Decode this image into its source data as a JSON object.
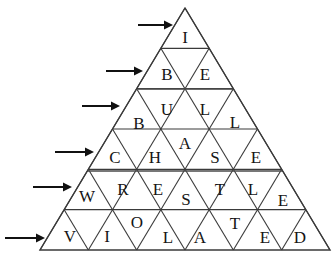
{
  "figure": {
    "background_color": "#ffffff",
    "line_color": "#3a3a3a",
    "text_color": "#151515",
    "arrow_color": "#111111",
    "apex": {
      "x": 185,
      "y": 8
    },
    "base_left": {
      "x": 40,
      "y": 250
    },
    "base_right": {
      "x": 330,
      "y": 250
    },
    "row_height": 40.3,
    "row_count": 6
  },
  "rows": [
    {
      "index": 1,
      "word": "I",
      "arrow_name": "row-1-arrow",
      "cells": [
        {
          "letter": "I",
          "orientation": "up",
          "x": 185,
          "y": 37
        }
      ]
    },
    {
      "index": 2,
      "word": "BE",
      "arrow_name": "row-2-arrow",
      "cells": [
        {
          "letter": "B",
          "orientation": "up",
          "x": 167,
          "y": 74
        },
        {
          "letter": "E",
          "orientation": "up",
          "x": 205,
          "y": 74
        }
      ]
    },
    {
      "index": 3,
      "word": "BULL",
      "arrow_name": "row-3-arrow",
      "cells": [
        {
          "letter": "B",
          "orientation": "up",
          "x": 139,
          "y": 123
        },
        {
          "letter": "U",
          "orientation": "down",
          "x": 167,
          "y": 109
        },
        {
          "letter": "L",
          "orientation": "up",
          "x": 205,
          "y": 109
        },
        {
          "letter": "L",
          "orientation": "down",
          "x": 235,
          "y": 122
        }
      ]
    },
    {
      "index": 4,
      "word": "CHASE",
      "arrow_name": "row-4-arrow",
      "cells": [
        {
          "letter": "C",
          "orientation": "up",
          "x": 115,
          "y": 157
        },
        {
          "letter": "H",
          "orientation": "down",
          "x": 155,
          "y": 157
        },
        {
          "letter": "A",
          "orientation": "up",
          "x": 185,
          "y": 143
        },
        {
          "letter": "S",
          "orientation": "down",
          "x": 215,
          "y": 157
        },
        {
          "letter": "E",
          "orientation": "up",
          "x": 256,
          "y": 157
        }
      ]
    },
    {
      "index": 5,
      "word": "WRESTLE",
      "arrow_name": "row-5-arrow",
      "cells": [
        {
          "letter": "W",
          "orientation": "up",
          "x": 87,
          "y": 196
        },
        {
          "letter": "R",
          "orientation": "down",
          "x": 123,
          "y": 189
        },
        {
          "letter": "E",
          "orientation": "up",
          "x": 158,
          "y": 189
        },
        {
          "letter": "S",
          "orientation": "down",
          "x": 186,
          "y": 199
        },
        {
          "letter": "T",
          "orientation": "up",
          "x": 220,
          "y": 189
        },
        {
          "letter": "L",
          "orientation": "down",
          "x": 253,
          "y": 189
        },
        {
          "letter": "E",
          "orientation": "up",
          "x": 283,
          "y": 200
        }
      ]
    },
    {
      "index": 6,
      "word": "VIOLATED",
      "arrow_name": "row-6-arrow",
      "cells": [
        {
          "letter": "V",
          "orientation": "up",
          "x": 70,
          "y": 236
        },
        {
          "letter": "I",
          "orientation": "down",
          "x": 107,
          "y": 236
        },
        {
          "letter": "O",
          "orientation": "up",
          "x": 137,
          "y": 222
        },
        {
          "letter": "L",
          "orientation": "down",
          "x": 168,
          "y": 237
        },
        {
          "letter": "A",
          "orientation": "up",
          "x": 200,
          "y": 237
        },
        {
          "letter": "T",
          "orientation": "down",
          "x": 235,
          "y": 223
        },
        {
          "letter": "E",
          "orientation": "up",
          "x": 265,
          "y": 237
        },
        {
          "letter": "D",
          "orientation": "down",
          "x": 300,
          "y": 237
        }
      ]
    }
  ],
  "arrows": [
    {
      "name": "row-1-arrow",
      "label": "arrow pointing to row 1",
      "x1": 138,
      "x2": 173,
      "y": 25
    },
    {
      "name": "row-2-arrow",
      "label": "arrow pointing to row 2",
      "x1": 106,
      "x2": 143,
      "y": 71
    },
    {
      "name": "row-3-arrow",
      "label": "arrow pointing to row 3",
      "x1": 82,
      "x2": 120,
      "y": 106
    },
    {
      "name": "row-4-arrow",
      "label": "arrow pointing to row 4",
      "x1": 55,
      "x2": 94,
      "y": 152
    },
    {
      "name": "row-5-arrow",
      "label": "arrow pointing to row 5",
      "x1": 33,
      "x2": 72,
      "y": 187
    },
    {
      "name": "row-6-arrow",
      "label": "arrow pointing to row 6",
      "x1": 5,
      "x2": 45,
      "y": 238
    }
  ],
  "dividers": [
    {
      "name": "divider-row2-row3",
      "x1": 138,
      "x2": 233,
      "y": 89
    },
    {
      "name": "divider-row4-row5",
      "x1": 87,
      "x2": 283,
      "y": 171
    }
  ],
  "font": {
    "letter_size_px": 17
  }
}
